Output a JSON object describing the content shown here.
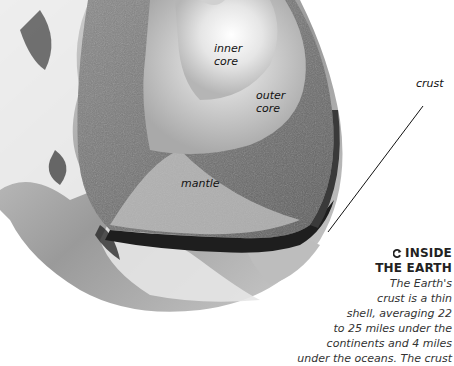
{
  "diagram": {
    "labels": {
      "inner_core": [
        "inner",
        "core"
      ],
      "outer_core": [
        "outer",
        "core"
      ],
      "mantle": "mantle",
      "crust": "crust"
    },
    "icon": "rotate-arrow-icon",
    "colors": {
      "background": "#ffffff",
      "text": "#222222"
    }
  },
  "caption": {
    "title_line1": "INSIDE",
    "title_line2": "THE EARTH",
    "body_lines": [
      "The Earth's",
      "crust is a thin",
      "shell, averaging 22",
      "to 25 miles under the",
      "continents and 4 miles",
      "under the oceans. The crust"
    ]
  }
}
